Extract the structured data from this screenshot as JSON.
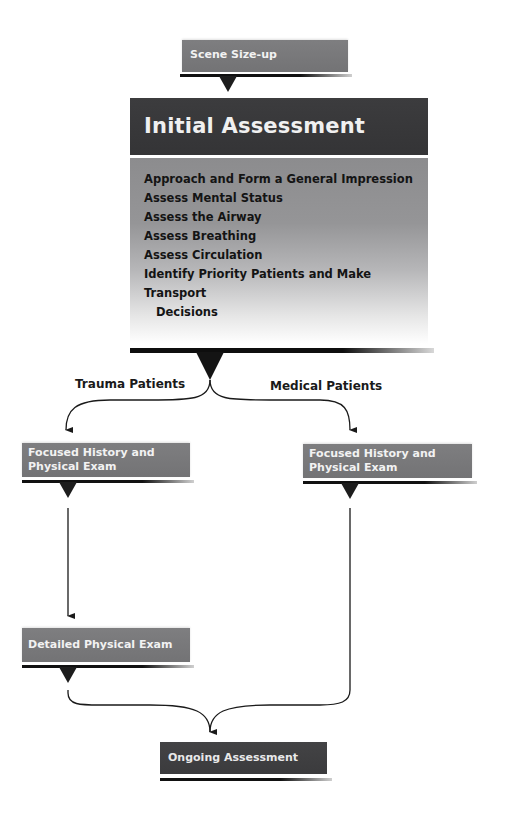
{
  "diagram": {
    "type": "flowchart",
    "nodes": {
      "scene_sizeup": {
        "label": "Scene Size-up"
      },
      "initial_assessment": {
        "title": "Initial Assessment",
        "steps": [
          "Approach and Form a General Impression",
          "Assess Mental Status",
          "Assess the Airway",
          "Assess Breathing",
          "Assess Circulation",
          "Identify Priority Patients and Make Transport",
          "Decisions"
        ]
      },
      "focused_trauma": {
        "line1": "Focused History and",
        "line2": "Physical Exam"
      },
      "focused_medical": {
        "line1": "Focused History and",
        "line2": "Physical Exam"
      },
      "detailed_exam": {
        "label": "Detailed Physical Exam"
      },
      "ongoing_assessment": {
        "label": "Ongoing Assessment"
      }
    },
    "branches": {
      "trauma": "Trauma Patients",
      "medical": "Medical Patients"
    },
    "edges": [
      [
        "Scene Size-up",
        "Initial Assessment"
      ],
      [
        "Initial Assessment",
        "Focused History and Physical Exam (Trauma)"
      ],
      [
        "Initial Assessment",
        "Focused History and Physical Exam (Medical)"
      ],
      [
        "Focused History and Physical Exam (Trauma)",
        "Detailed Physical Exam"
      ],
      [
        "Detailed Physical Exam",
        "Ongoing Assessment"
      ],
      [
        "Focused History and Physical Exam (Medical)",
        "Ongoing Assessment"
      ]
    ],
    "colors": {
      "box_gray": "#787879",
      "box_dark": "#3d3d3f",
      "header_dark": "#38383a",
      "text_light": "#f0f0f0",
      "text_dark": "#141414",
      "line": "#1a1a1a"
    }
  }
}
